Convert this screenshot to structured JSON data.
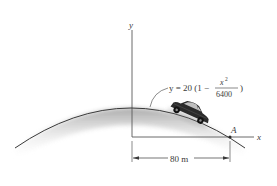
{
  "figure": {
    "axes": {
      "y_label": "y",
      "x_label": "x"
    },
    "equation": {
      "prefix": "y = 20 (1 −",
      "numerator": "x",
      "numerator_exp": "2",
      "denominator": "6400",
      "suffix": ")"
    },
    "point": {
      "label": "A"
    },
    "dimension": {
      "label": "80 m"
    },
    "colors": {
      "line": "#3a3a3a",
      "shade": "#9a9a9a",
      "car_body": "#2b2b2b"
    }
  }
}
